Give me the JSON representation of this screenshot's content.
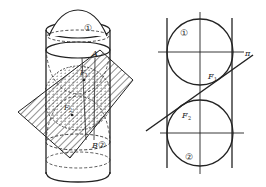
{
  "figure": {
    "left_view": {
      "labels": {
        "sphere_top": "①",
        "sphere_bottom": "②",
        "point_a": "A",
        "point_b": "B",
        "focus_1": "F",
        "focus_1_sub": "1",
        "focus_2": "F",
        "focus_2_sub": "2"
      }
    },
    "right_view": {
      "labels": {
        "sphere_top": "①",
        "sphere_bottom": "②",
        "plane": "π",
        "focus_1": "F",
        "focus_1_sub": "1",
        "focus_2": "F",
        "focus_2_sub": "2"
      }
    },
    "colors": {
      "ink": "#222222",
      "background": "#ffffff"
    }
  }
}
